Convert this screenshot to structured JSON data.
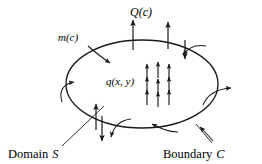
{
  "figure": {
    "name": "domain-boundary-flux-diagram",
    "type": "diagram",
    "background_color": "#ffffff",
    "ink_color": "#1a1a1a"
  },
  "labels": {
    "top_flux": "Q(c)",
    "boundary_flux": "m(c)",
    "interior_source": "q(x, y)",
    "domain_label": "Domain S",
    "domain_label_plain": "Domain",
    "domain_label_italic": "S",
    "boundary_label": "Boundary C",
    "boundary_label_plain": "Boundary",
    "boundary_label_italic": "C"
  },
  "geometry": {
    "ellipse": {
      "cx": 142,
      "cy": 84,
      "rx": 76,
      "ry": 44,
      "stroke_width": 1.3
    }
  },
  "interior_arrows": {
    "description": "staggered grid of small upward source arrows labelled q(x, y)",
    "count": 9,
    "direction": "up",
    "items": [
      {
        "x": 147,
        "y_tail": 80,
        "y_head": 64
      },
      {
        "x": 158,
        "y_tail": 78,
        "y_head": 62
      },
      {
        "x": 169,
        "y_tail": 80,
        "y_head": 64
      },
      {
        "x": 147,
        "y_tail": 93,
        "y_head": 77
      },
      {
        "x": 158,
        "y_tail": 95,
        "y_head": 79
      },
      {
        "x": 169,
        "y_tail": 93,
        "y_head": 77
      },
      {
        "x": 147,
        "y_tail": 104,
        "y_head": 90
      },
      {
        "x": 158,
        "y_tail": 106,
        "y_head": 92
      },
      {
        "x": 169,
        "y_tail": 104,
        "y_head": 90
      }
    ]
  },
  "flux_arrows": {
    "description": "straight arrows crossing the boundary C",
    "items": [
      {
        "name": "top-outflow-left",
        "x1": 133,
        "y1": 48,
        "x2": 133,
        "y2": 20,
        "label_ref": "top_flux"
      },
      {
        "name": "top-outflow-right",
        "x1": 168,
        "y1": 47,
        "x2": 168,
        "y2": 22,
        "label_ref": "top_flux"
      },
      {
        "name": "left-upflow",
        "x1": 96,
        "y1": 128,
        "x2": 96,
        "y2": 104,
        "label_ref": "boundary_flux"
      },
      {
        "name": "bottom-outflow",
        "x1": 102,
        "y1": 118,
        "x2": 102,
        "y2": 140,
        "label_ref": "boundary_flux"
      },
      {
        "name": "right-downflow",
        "x1": 185,
        "y1": 40,
        "x2": 185,
        "y2": 58,
        "label_ref": "boundary_flux"
      }
    ]
  },
  "boundary_hooks": {
    "description": "curved hook arrows indicating normal flux m(c) around the boundary",
    "items": [
      {
        "name": "hook-upper-left-inward",
        "direction": "inward"
      },
      {
        "name": "hook-upper-right-inward",
        "direction": "inward"
      },
      {
        "name": "hook-left-inward",
        "direction": "inward"
      },
      {
        "name": "hook-right-outward",
        "direction": "outward"
      },
      {
        "name": "hook-lower-left-outward",
        "direction": "outward"
      },
      {
        "name": "hook-bottom-inward",
        "direction": "inward"
      },
      {
        "name": "hook-lower-right-inward",
        "direction": "inward"
      }
    ]
  },
  "leaders": [
    {
      "name": "domain-leader",
      "from_label": "Domain S",
      "to": "interior of ellipse"
    },
    {
      "name": "boundary-leader",
      "from_label": "Boundary C",
      "to": "ellipse perimeter"
    }
  ]
}
